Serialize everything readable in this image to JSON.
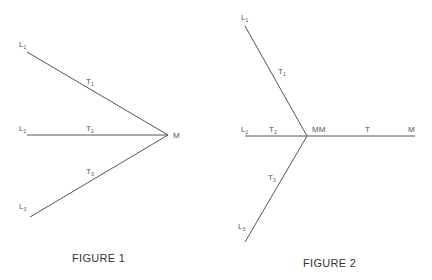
{
  "figures": [
    {
      "caption": "FIGURE 1",
      "labels": {
        "L1": {
          "base": "L",
          "sub": "1"
        },
        "L2": {
          "base": "L",
          "sub": "2"
        },
        "L3": {
          "base": "L",
          "sub": "3"
        },
        "T1": {
          "base": "T",
          "sub": "1"
        },
        "T2": {
          "base": "T",
          "sub": "2"
        },
        "T3": {
          "base": "T",
          "sub": "3"
        },
        "M": "M"
      }
    },
    {
      "caption": "FIGURE 2",
      "labels": {
        "L1": {
          "base": "L",
          "sub": "1"
        },
        "L2": {
          "base": "L",
          "sub": "2"
        },
        "L3": {
          "base": "L",
          "sub": "3"
        },
        "T1": {
          "base": "T",
          "sub": "1"
        },
        "T2": {
          "base": "T",
          "sub": "2"
        },
        "T3": {
          "base": "T",
          "sub": "3"
        },
        "MM": "MM",
        "T": "T",
        "M": "M"
      }
    }
  ],
  "style": {
    "line_color": "#555555"
  }
}
